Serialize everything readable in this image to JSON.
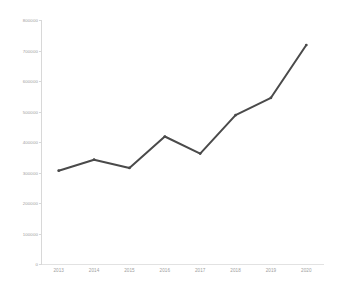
{
  "chart_data": {
    "type": "line",
    "title": "",
    "subtitle": "",
    "xlabel": "",
    "ylabel": "",
    "categories": [
      "2013",
      "2014",
      "2015",
      "2016",
      "2017",
      "2018",
      "2019",
      "2020"
    ],
    "values": [
      306000,
      342000,
      315000,
      418000,
      362000,
      488000,
      545000,
      718000
    ],
    "series": [
      {
        "name": "",
        "values": [
          306000,
          342000,
          315000,
          418000,
          362000,
          488000,
          545000,
          718000
        ]
      }
    ],
    "ylim": [
      0,
      800000
    ],
    "yticks": [
      0,
      100000,
      200000,
      300000,
      400000,
      500000,
      600000,
      700000,
      800000
    ],
    "ytick_labels": [
      "0",
      "100000",
      "200000",
      "300000",
      "400000",
      "500000",
      "600000",
      "700000",
      "800000"
    ],
    "xtick_labels": [
      "2013",
      "2014",
      "2015",
      "2016",
      "2017",
      "2018",
      "2019",
      "2020"
    ],
    "grid": false,
    "legend": false,
    "legend_position": "none",
    "annotations": [],
    "line_color": "#4a4a4a",
    "marker": "none",
    "line_width": 2
  },
  "caption": {
    "text": ""
  },
  "colors": {
    "line": "#4a4a4a",
    "axis": "#d8d8d8",
    "tick_label": "#9e9e9e",
    "background": "#ffffff",
    "caption": "#b4b4b4"
  }
}
